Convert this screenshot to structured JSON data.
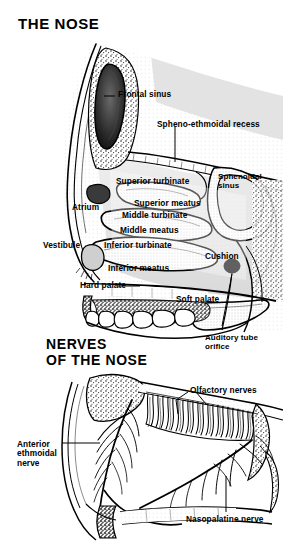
{
  "figure": {
    "type": "anatomical-illustration",
    "background_color": "#ffffff",
    "ink_color": "#000000",
    "style": "black-and-white stippled line engraving"
  },
  "panels": [
    {
      "id": "panel-nose",
      "heading": "THE NOSE",
      "labels": [
        {
          "name": "frontal-sinus",
          "text": "Frontal sinus",
          "x": 118,
          "y": 90,
          "leader": true
        },
        {
          "name": "spheno-ethmoidal-recess",
          "text": "Spheno-ethmoidal recess",
          "x": 157,
          "y": 120,
          "leader": true
        },
        {
          "name": "superior-turbinate",
          "text": "Superior turbinate",
          "x": 116,
          "y": 177,
          "leader": false
        },
        {
          "name": "sphenoidal-sinus",
          "text": "Sphenoidal\nsinus",
          "x": 218,
          "y": 172,
          "leader": false
        },
        {
          "name": "superior-meatus",
          "text": "Superior meatus",
          "x": 134,
          "y": 199,
          "leader": false
        },
        {
          "name": "atrium",
          "text": "Atrium",
          "x": 72,
          "y": 203,
          "leader": false
        },
        {
          "name": "middle-turbinate",
          "text": "Middle turbinate",
          "x": 122,
          "y": 211,
          "leader": false
        },
        {
          "name": "middle-meatus",
          "text": "Middle meatus",
          "x": 120,
          "y": 226,
          "leader": false
        },
        {
          "name": "vestibule",
          "text": "Vestibule",
          "x": 43,
          "y": 241,
          "leader": false
        },
        {
          "name": "inferior-turbinate",
          "text": "Inferior turbinate",
          "x": 104,
          "y": 241,
          "leader": false
        },
        {
          "name": "cushion",
          "text": "Cushion",
          "x": 205,
          "y": 252,
          "leader": false
        },
        {
          "name": "inferior-meatus",
          "text": "Inferior meatus",
          "x": 108,
          "y": 264,
          "leader": false
        },
        {
          "name": "hard-palate",
          "text": "Hard palate",
          "x": 80,
          "y": 281,
          "leader": true
        },
        {
          "name": "soft-palate",
          "text": "Soft palate",
          "x": 176,
          "y": 295,
          "leader": false
        },
        {
          "name": "auditory-tube-orifice",
          "text": "Auditory tube\norifice",
          "x": 205,
          "y": 333,
          "leader": true
        }
      ]
    },
    {
      "id": "panel-nerves",
      "heading": "NERVES\nOF THE NOSE",
      "labels": [
        {
          "name": "olfactory-nerves",
          "text": "Olfactory nerves",
          "x": 190,
          "y": 386,
          "leader": true
        },
        {
          "name": "anterior-ethmoidal-nerve",
          "text": "Anterior\nethmoidal\nnerve",
          "x": 17,
          "y": 440,
          "leader": true
        },
        {
          "name": "nasopalatine-nerve",
          "text": "Nasopalatine nerve",
          "x": 186,
          "y": 515,
          "leader": true
        }
      ]
    }
  ]
}
